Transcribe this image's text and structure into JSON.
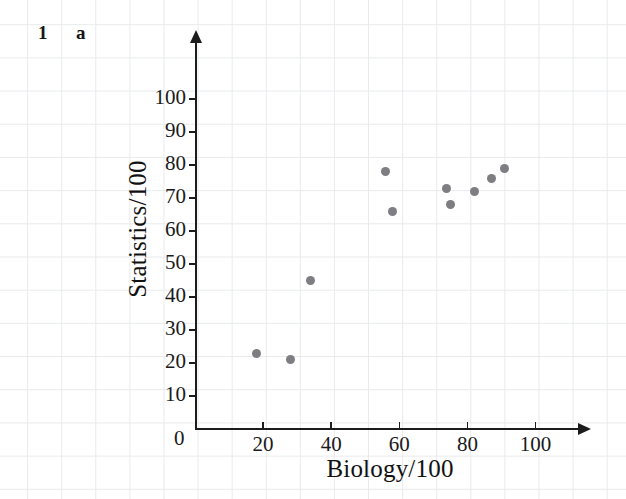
{
  "question": {
    "number": "1",
    "part": "a"
  },
  "chart_data": {
    "type": "scatter",
    "title": "",
    "xlabel": "Biology/100",
    "ylabel": "Statistics/100",
    "xlim": [
      0,
      112
    ],
    "ylim": [
      0,
      117
    ],
    "xticks": [
      0,
      20,
      40,
      60,
      80,
      100
    ],
    "xtick_labels": [
      "0",
      "20",
      "40",
      "60",
      "80",
      "100"
    ],
    "yticks": [
      10,
      20,
      30,
      40,
      50,
      60,
      70,
      80,
      90,
      100
    ],
    "ytick_labels": [
      "10",
      "20",
      "30",
      "40",
      "50",
      "60",
      "70",
      "80",
      "90",
      "100"
    ],
    "grid": true,
    "legend": "none",
    "marker_color": "#7d7d82",
    "axis_color": "#1c1c1c",
    "grid_color": "#e9eaec",
    "points": [
      {
        "x": 18,
        "y": 23
      },
      {
        "x": 28,
        "y": 21
      },
      {
        "x": 34,
        "y": 45
      },
      {
        "x": 56,
        "y": 78
      },
      {
        "x": 58,
        "y": 66
      },
      {
        "x": 74,
        "y": 73
      },
      {
        "x": 75,
        "y": 68
      },
      {
        "x": 82,
        "y": 72
      },
      {
        "x": 87,
        "y": 76
      },
      {
        "x": 91,
        "y": 79
      }
    ]
  }
}
